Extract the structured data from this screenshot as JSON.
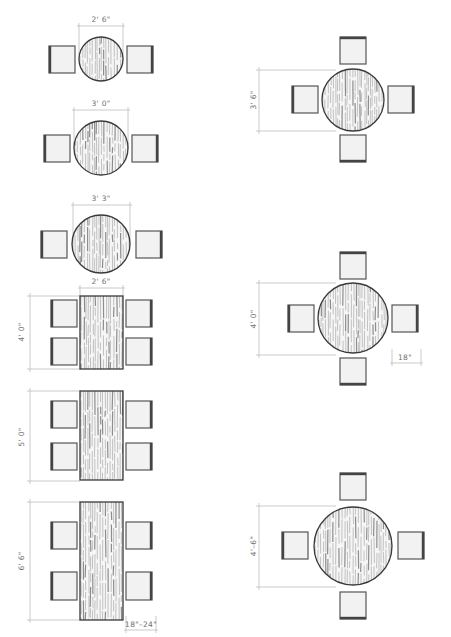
{
  "diagram": {
    "type": "architectural-plan",
    "colors": {
      "background": "#ffffff",
      "outline": "#3a3a3a",
      "chair_fill": "#f2f2f2",
      "wood_grain": "#a9a9a9",
      "dimension": "#bdbdbd",
      "dimension_text": "#6f6f6f"
    },
    "layouts": [
      {
        "id": "round-2-seat-small",
        "shape": "round",
        "seats": 2,
        "dimension_label": "2' 6\"",
        "dimension_orientation": "horizontal",
        "table": {
          "cx": 101,
          "cy": 59,
          "r": 22
        },
        "chairs": [
          {
            "x": 49,
            "y": 46,
            "w": 26,
            "h": 27,
            "back": "left"
          },
          {
            "x": 127,
            "y": 46,
            "w": 26,
            "h": 27,
            "back": "right"
          }
        ],
        "dim": {
          "x1": 79,
          "x2": 123,
          "y": 26,
          "text_x": 101,
          "text_y": 22
        }
      },
      {
        "id": "round-2-seat-medium",
        "shape": "round",
        "seats": 2,
        "dimension_label": "3' 0\"",
        "dimension_orientation": "horizontal",
        "table": {
          "cx": 101,
          "cy": 148,
          "r": 27
        },
        "chairs": [
          {
            "x": 44,
            "y": 135,
            "w": 26,
            "h": 27,
            "back": "left"
          },
          {
            "x": 132,
            "y": 135,
            "w": 26,
            "h": 27,
            "back": "right"
          }
        ],
        "dim": {
          "x1": 74,
          "x2": 128,
          "y": 110,
          "text_x": 101,
          "text_y": 106
        }
      },
      {
        "id": "round-2-seat-large",
        "shape": "round",
        "seats": 2,
        "dimension_label": "3' 3\"",
        "dimension_orientation": "horizontal",
        "table": {
          "cx": 101,
          "cy": 244,
          "r": 29
        },
        "chairs": [
          {
            "x": 41,
            "y": 231,
            "w": 26,
            "h": 27,
            "back": "left"
          },
          {
            "x": 136,
            "y": 231,
            "w": 26,
            "h": 27,
            "back": "right"
          }
        ],
        "dim": {
          "x1": 73,
          "x2": 130,
          "y": 205,
          "text_x": 101,
          "text_y": 201
        }
      },
      {
        "id": "rect-4-seat",
        "shape": "rectangular",
        "seats": 4,
        "dimension_label": "4' 0\"",
        "width_label": "2' 6\"",
        "dimension_orientation": "vertical",
        "table": {
          "x": 80,
          "y": 296,
          "w": 43,
          "h": 73
        },
        "chairs": [
          {
            "x": 51,
            "y": 300,
            "w": 26,
            "h": 27,
            "back": "left"
          },
          {
            "x": 51,
            "y": 338,
            "w": 26,
            "h": 27,
            "back": "left"
          },
          {
            "x": 126,
            "y": 300,
            "w": 26,
            "h": 27,
            "back": "right"
          },
          {
            "x": 126,
            "y": 338,
            "w": 26,
            "h": 27,
            "back": "right"
          }
        ],
        "dim": {
          "x": 30,
          "y1": 296,
          "y2": 369,
          "text_x": 24,
          "text_y": 332
        },
        "width_dim": {
          "x1": 80,
          "x2": 123,
          "y": 288,
          "text_x": 101,
          "text_y": 284
        }
      },
      {
        "id": "rect-4-seat-long",
        "shape": "rectangular",
        "seats": 4,
        "dimension_label": "5' 0\"",
        "dimension_orientation": "vertical",
        "table": {
          "x": 80,
          "y": 391,
          "w": 43,
          "h": 89
        },
        "chairs": [
          {
            "x": 51,
            "y": 401,
            "w": 26,
            "h": 27,
            "back": "left"
          },
          {
            "x": 51,
            "y": 443,
            "w": 26,
            "h": 27,
            "back": "left"
          },
          {
            "x": 126,
            "y": 401,
            "w": 26,
            "h": 27,
            "back": "right"
          },
          {
            "x": 126,
            "y": 443,
            "w": 26,
            "h": 27,
            "back": "right"
          }
        ],
        "dim": {
          "x": 30,
          "y1": 391,
          "y2": 481,
          "text_x": 24,
          "text_y": 437
        }
      },
      {
        "id": "rect-4-seat-extra-long",
        "shape": "rectangular",
        "seats": 4,
        "dimension_label": "6' 6\"",
        "clearance_label": "18\"–24\"",
        "dimension_orientation": "vertical",
        "table": {
          "x": 80,
          "y": 502,
          "w": 43,
          "h": 118
        },
        "chairs": [
          {
            "x": 51,
            "y": 522,
            "w": 26,
            "h": 27,
            "back": "left"
          },
          {
            "x": 51,
            "y": 572,
            "w": 26,
            "h": 28,
            "back": "left"
          },
          {
            "x": 126,
            "y": 522,
            "w": 26,
            "h": 27,
            "back": "right"
          },
          {
            "x": 126,
            "y": 572,
            "w": 26,
            "h": 28,
            "back": "right"
          }
        ],
        "dim": {
          "x": 30,
          "y1": 502,
          "y2": 620,
          "text_x": 24,
          "text_y": 561
        },
        "clearance_dim": {
          "x1": 126,
          "x2": 156,
          "y": 630,
          "text_x": 141,
          "text_y": 627
        }
      },
      {
        "id": "round-4-seat-small",
        "shape": "round",
        "seats": 4,
        "dimension_label": "3' 6\"",
        "dimension_orientation": "vertical",
        "table": {
          "cx": 353,
          "cy": 100,
          "r": 31
        },
        "chairs": [
          {
            "x": 340,
            "y": 37,
            "w": 26,
            "h": 27,
            "back": "top"
          },
          {
            "x": 340,
            "y": 135,
            "w": 26,
            "h": 27,
            "back": "bottom"
          },
          {
            "x": 292,
            "y": 86,
            "w": 26,
            "h": 27,
            "back": "left"
          },
          {
            "x": 388,
            "y": 86,
            "w": 26,
            "h": 27,
            "back": "right"
          }
        ],
        "dim": {
          "x": 259,
          "y1": 70,
          "y2": 131,
          "x_end": 336,
          "text_x": 256,
          "text_y": 100
        }
      },
      {
        "id": "round-4-seat-medium",
        "shape": "round",
        "seats": 4,
        "dimension_label": "4' 0\"",
        "clearance_label": "18\"",
        "dimension_orientation": "vertical",
        "table": {
          "cx": 353,
          "cy": 318,
          "r": 35
        },
        "chairs": [
          {
            "x": 340,
            "y": 252,
            "w": 26,
            "h": 27,
            "back": "top"
          },
          {
            "x": 340,
            "y": 358,
            "w": 26,
            "h": 27,
            "back": "bottom"
          },
          {
            "x": 288,
            "y": 305,
            "w": 26,
            "h": 27,
            "back": "left"
          },
          {
            "x": 392,
            "y": 305,
            "w": 26,
            "h": 27,
            "back": "right"
          }
        ],
        "dim": {
          "x": 259,
          "y1": 283,
          "y2": 355,
          "x_end": 336,
          "text_x": 256,
          "text_y": 319
        },
        "clearance_dim": {
          "x1": 392,
          "x2": 421,
          "y": 363,
          "text_x": 405,
          "text_y": 360
        }
      },
      {
        "id": "round-4-seat-large",
        "shape": "round",
        "seats": 4,
        "dimension_label": "4'–6\"",
        "dimension_orientation": "vertical",
        "table": {
          "cx": 353,
          "cy": 546,
          "r": 39
        },
        "chairs": [
          {
            "x": 340,
            "y": 473,
            "w": 26,
            "h": 27,
            "back": "top"
          },
          {
            "x": 340,
            "y": 592,
            "w": 26,
            "h": 27,
            "back": "bottom"
          },
          {
            "x": 282,
            "y": 532,
            "w": 26,
            "h": 27,
            "back": "left"
          },
          {
            "x": 398,
            "y": 532,
            "w": 26,
            "h": 27,
            "back": "right"
          }
        ],
        "dim": {
          "x": 259,
          "y1": 506,
          "y2": 587,
          "x_end": 336,
          "text_x": 256,
          "text_y": 546
        }
      }
    ]
  }
}
